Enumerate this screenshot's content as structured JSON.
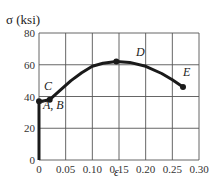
{
  "chart_data": {
    "type": "line",
    "title": "",
    "ylabel": "σ (ksi)",
    "xlabel": "ε",
    "xlim": [
      0,
      0.3
    ],
    "ylim": [
      0,
      80
    ],
    "grid": true,
    "x_ticks": [
      "0",
      "0.05",
      "0.10",
      "0.15",
      "0.20",
      "0.25",
      "0.30"
    ],
    "y_ticks": [
      "0",
      "20",
      "40",
      "60",
      "80"
    ],
    "series": [
      {
        "name": "stress-strain curve",
        "x": [
          0,
          0.0,
          0.005,
          0.02,
          0.04,
          0.06,
          0.08,
          0.1,
          0.12,
          0.145,
          0.17,
          0.2,
          0.23,
          0.25,
          0.27
        ],
        "y": [
          0,
          37,
          37,
          38,
          44,
          50,
          55,
          59,
          61,
          62,
          61.5,
          59,
          54.5,
          50.5,
          46
        ]
      }
    ],
    "points": [
      {
        "label": "A, B",
        "x": 0.0,
        "y": 37
      },
      {
        "label": "C",
        "x": 0.02,
        "y": 38
      },
      {
        "label": "D",
        "x": 0.145,
        "y": 62
      },
      {
        "label": "E",
        "x": 0.27,
        "y": 46
      }
    ]
  },
  "labels": {
    "y_axis": "σ (ksi)",
    "x_axis": "ε",
    "point_ab": "A, B",
    "point_c": "C",
    "point_d": "D",
    "point_e": "E"
  },
  "colors": {
    "curve": "#1a1a1a",
    "grid": "#555555",
    "background": "#ffffff"
  }
}
